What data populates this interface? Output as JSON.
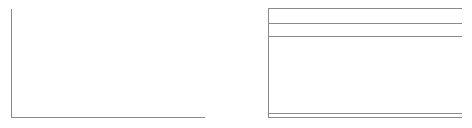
{
  "canvas": {
    "width": 472,
    "height": 128,
    "background": "#ffffff",
    "content_text": ""
  },
  "style": {
    "rule_color": "#8a8a8a",
    "rule_color_light": "#9e9e9e",
    "rule_width_px": 1
  },
  "plot_panel": {
    "name": "empty-plot-frame",
    "description": "L-shaped axis frame with no plotted data, no tick labels and no axis titles",
    "axis_color": "#8a8a8a",
    "y_axis": {
      "x": 11,
      "y_top": 9,
      "y_bottom": 117
    },
    "x_axis": {
      "y": 117,
      "x_left": 11,
      "x_right": 205
    },
    "tick_labels_x": [],
    "tick_labels_y": [],
    "title": "",
    "xlabel": "",
    "ylabel": ""
  },
  "table_panel": {
    "name": "empty-table-frame",
    "description": "Open table frame: left vertical border, three top rules forming header bands, and a double closing rule at the bottom. No cell text.",
    "rule_color": "#8a8a8a",
    "left_border": {
      "x": 268,
      "y_top": 8,
      "y_bottom": 117
    },
    "span": {
      "x_left": 268,
      "x_right": 462
    },
    "rules": [
      {
        "id": "top-rule",
        "y": 8,
        "weight": 1
      },
      {
        "id": "header-divider-rule",
        "y": 23,
        "weight": 1
      },
      {
        "id": "subheader-divider-rule",
        "y": 36,
        "weight": 1
      },
      {
        "id": "bottom-rule-upper",
        "y": 113,
        "weight": 1
      },
      {
        "id": "bottom-rule-lower",
        "y": 117,
        "weight": 1
      }
    ],
    "column_headers": [],
    "rows": []
  },
  "chart_data": {
    "type": "table",
    "title": "",
    "subtitle": "",
    "xlabel": "",
    "ylabel": "",
    "grid": false,
    "legend": null,
    "categories": [],
    "values": [],
    "series": [],
    "columns": [],
    "rows": [],
    "note": "Both panels are empty frames rendered with rules only; the screenshot contains no numeric data, tick labels, legend entries or annotations."
  }
}
